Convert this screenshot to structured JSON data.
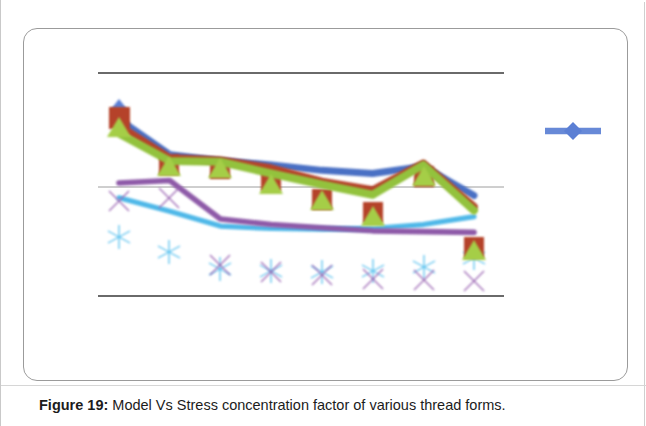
{
  "document": {
    "background_color": "#ffffff",
    "page_border_color": "#c9c9c9"
  },
  "figure": {
    "card_border_color": "#9b9b9b",
    "caption_label": "Figure 19:",
    "caption_text": " Model Vs Stress concentration factor of various thread forms."
  },
  "legend": {
    "marker_name": "diamond-marker",
    "marker_color": "#5b7fd4",
    "line_color": "#5b7fd4",
    "label": ""
  },
  "chart_data": {
    "type": "line",
    "title": "",
    "subtitle": "",
    "xlabel": "",
    "ylabel": "",
    "grid": true,
    "gridlines_y": [
      1.0,
      0.5,
      0.0
    ],
    "legend_position": "right",
    "axis_hidden": true,
    "tick_labels_hidden": true,
    "x": [
      1,
      2,
      3,
      4,
      5,
      6,
      7,
      8
    ],
    "categories": [
      "1",
      "2",
      "3",
      "4",
      "5",
      "6",
      "7",
      "8"
    ],
    "xlim": [
      0.6,
      8.4
    ],
    "ylim": [
      -0.28,
      1.14
    ],
    "series": [
      {
        "name": "Series 1",
        "color": "#4a6fc4",
        "marker": "diamond",
        "values": [
          0.845,
          0.62,
          0.58,
          0.555,
          0.52,
          0.5,
          0.545,
          0.36
        ]
      },
      {
        "name": "Series 2",
        "color": "#b5432c",
        "marker": "square",
        "values": [
          0.805,
          0.6,
          0.585,
          0.535,
          0.45,
          0.395,
          0.565,
          0.29
        ]
      },
      {
        "name": "Series 3",
        "color": "#93c23c",
        "marker": "triangle",
        "values": [
          0.755,
          0.58,
          0.575,
          0.5,
          0.43,
          0.365,
          0.555,
          0.265
        ]
      },
      {
        "name": "Series 4",
        "color": "#8e5aa8",
        "marker": "x",
        "values": [
          0.44,
          0.455,
          0.21,
          0.175,
          0.155,
          0.135,
          0.13,
          0.125
        ]
      },
      {
        "name": "Series 5",
        "color": "#4fb8e8",
        "marker": "asterisk",
        "values": [
          0.345,
          0.26,
          0.165,
          0.15,
          0.145,
          0.15,
          0.175,
          0.225
        ]
      }
    ]
  }
}
